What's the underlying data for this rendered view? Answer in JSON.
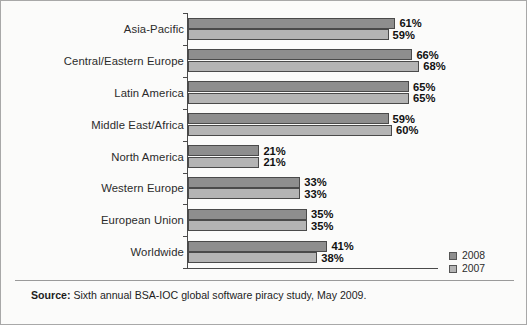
{
  "chart_data": {
    "type": "bar",
    "orientation": "horizontal",
    "title": "",
    "xlabel": "",
    "ylabel": "",
    "xlim": [
      0,
      75
    ],
    "grid": false,
    "legend_position": "bottom-right",
    "categories": [
      "Asia-Pacific",
      "Central/Eastern Europe",
      "Latin America",
      "Middle East/Africa",
      "North America",
      "Western Europe",
      "European Union",
      "Worldwide"
    ],
    "series": [
      {
        "name": "2008",
        "color": "#8e8e8e",
        "values": [
          61,
          66,
          65,
          59,
          21,
          33,
          35,
          41
        ],
        "labels": [
          "61%",
          "66%",
          "65%",
          "59%",
          "21%",
          "33%",
          "35%",
          "41%"
        ]
      },
      {
        "name": "2007",
        "color": "#b4b4b4",
        "values": [
          59,
          68,
          65,
          60,
          21,
          33,
          35,
          38
        ],
        "labels": [
          "59%",
          "68%",
          "65%",
          "60%",
          "21%",
          "33%",
          "35%",
          "38%"
        ]
      }
    ]
  },
  "legend": {
    "items": [
      {
        "label": "2008",
        "color": "#8e8e8e"
      },
      {
        "label": "2007",
        "color": "#b4b4b4"
      }
    ]
  },
  "source": {
    "label": "Source:",
    "text": " Sixth annual BSA-IOC global software piracy study, May 2009."
  }
}
